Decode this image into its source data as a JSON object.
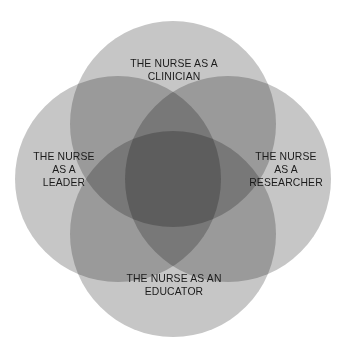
{
  "figure": {
    "type": "venn-diagram",
    "set_count": 4,
    "background_color": "#ffffff",
    "circle_fill_color": "#c6c6c6",
    "overlap_two_color": "#8a8a8a",
    "overlap_center_color": "#3d3d3d",
    "text_color": "#1b1b1b"
  },
  "sets": [
    {
      "position": "top",
      "label": "THE NURSE AS A\nCLINICIAN",
      "role": "clinician",
      "center_x": 173,
      "center_y": 124,
      "radius": 103
    },
    {
      "position": "left",
      "label": "THE NURSE\nAS A\nLEADER",
      "role": "leader",
      "center_x": 118,
      "center_y": 179,
      "radius": 103
    },
    {
      "position": "right",
      "label": "THE NURSE\nAS A\nRESEARCHER",
      "role": "researcher",
      "center_x": 228,
      "center_y": 179,
      "radius": 103
    },
    {
      "position": "bottom",
      "label": "THE NURSE AS AN\nEDUCATOR",
      "role": "educator",
      "center_x": 173,
      "center_y": 234,
      "radius": 103
    }
  ]
}
